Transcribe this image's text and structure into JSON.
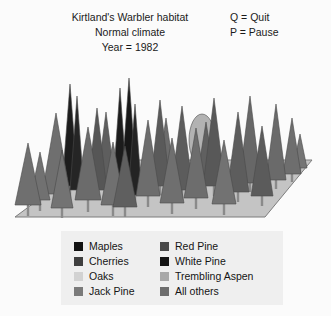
{
  "header": {
    "title_lines": [
      "Kirtland's Warbler habitat",
      "Normal climate",
      "Year = 1982"
    ],
    "keys": [
      "Q = Quit",
      "P = Pause"
    ]
  },
  "scene": {
    "ground_color": "#c4c4c4",
    "ground_edge_color": "#7d7d7d",
    "background_color": "#fbfbfb",
    "trunk_color": "#8a8a8a",
    "ground_polygon": "15,217 92,160 312,160 265,217",
    "trees": [
      {
        "species": "Jack Pine",
        "shape": "cone",
        "x": 28,
        "base": 205,
        "top": 143,
        "half_width": 13,
        "color": "#6f6f6f",
        "trunk_bottom": 216
      },
      {
        "species": "Jack Pine",
        "shape": "cone",
        "x": 56,
        "base": 194,
        "top": 113,
        "half_width": 14,
        "color": "#6f6f6f",
        "trunk_bottom": 206
      },
      {
        "species": "White Pine",
        "shape": "cone",
        "x": 70,
        "base": 186,
        "top": 84,
        "half_width": 8,
        "color": "#1d1d1d",
        "trunk_bottom": 198
      },
      {
        "species": "White Pine",
        "shape": "cone",
        "x": 77,
        "base": 190,
        "top": 96,
        "half_width": 7,
        "color": "#252525",
        "trunk_bottom": 200
      },
      {
        "species": "Jack Pine",
        "shape": "cone",
        "x": 62,
        "base": 208,
        "top": 150,
        "half_width": 11,
        "color": "#737373",
        "trunk_bottom": 218
      },
      {
        "species": "Jack Pine",
        "shape": "cone",
        "x": 88,
        "base": 200,
        "top": 127,
        "half_width": 13,
        "color": "#6b6b6b",
        "trunk_bottom": 212
      },
      {
        "species": "Red Pine",
        "shape": "cone",
        "x": 97,
        "base": 190,
        "top": 108,
        "half_width": 10,
        "color": "#565656",
        "trunk_bottom": 200
      },
      {
        "species": "Jack Pine",
        "shape": "cone",
        "x": 113,
        "base": 205,
        "top": 142,
        "half_width": 12,
        "color": "#707070",
        "trunk_bottom": 216
      },
      {
        "species": "White Pine",
        "shape": "cone",
        "x": 120,
        "base": 183,
        "top": 88,
        "half_width": 7,
        "color": "#1c1c1c",
        "trunk_bottom": 192
      },
      {
        "species": "White Pine",
        "shape": "cone",
        "x": 129,
        "base": 186,
        "top": 78,
        "half_width": 8,
        "color": "#171717",
        "trunk_bottom": 196
      },
      {
        "species": "White Pine",
        "shape": "cone",
        "x": 135,
        "base": 195,
        "top": 104,
        "half_width": 7,
        "color": "#232323",
        "trunk_bottom": 206
      },
      {
        "species": "Red Pine",
        "shape": "cone",
        "x": 125,
        "base": 207,
        "top": 146,
        "half_width": 12,
        "color": "#5f5f5f",
        "trunk_bottom": 217
      },
      {
        "species": "Jack Pine",
        "shape": "cone",
        "x": 148,
        "base": 196,
        "top": 120,
        "half_width": 12,
        "color": "#6d6d6d",
        "trunk_bottom": 207
      },
      {
        "species": "Red Pine",
        "shape": "cone",
        "x": 160,
        "base": 186,
        "top": 100,
        "half_width": 10,
        "color": "#5a5a5a",
        "trunk_bottom": 195
      },
      {
        "species": "Jack Pine",
        "shape": "cone",
        "x": 172,
        "base": 203,
        "top": 138,
        "half_width": 12,
        "color": "#6f6f6f",
        "trunk_bottom": 214
      },
      {
        "species": "Red Pine",
        "shape": "cone",
        "x": 182,
        "base": 190,
        "top": 106,
        "half_width": 11,
        "color": "#5c5c5c",
        "trunk_bottom": 200
      },
      {
        "species": "Oaks",
        "shape": "oval",
        "x": 202,
        "base": 166,
        "top": 114,
        "half_width": 13,
        "color": "#b2b2b2",
        "trunk_bottom": 180
      },
      {
        "species": "Jack Pine",
        "shape": "cone",
        "x": 196,
        "base": 198,
        "top": 128,
        "half_width": 12,
        "color": "#6d6d6d",
        "trunk_bottom": 209
      },
      {
        "species": "Red Pine",
        "shape": "cone",
        "x": 214,
        "base": 186,
        "top": 98,
        "half_width": 11,
        "color": "#585858",
        "trunk_bottom": 196
      },
      {
        "species": "Jack Pine",
        "shape": "cone",
        "x": 224,
        "base": 204,
        "top": 140,
        "half_width": 12,
        "color": "#727272",
        "trunk_bottom": 215
      },
      {
        "species": "Red Pine",
        "shape": "cone",
        "x": 238,
        "base": 192,
        "top": 112,
        "half_width": 11,
        "color": "#5d5d5d",
        "trunk_bottom": 202
      },
      {
        "species": "Jack Pine",
        "shape": "cone",
        "x": 250,
        "base": 183,
        "top": 96,
        "half_width": 11,
        "color": "#676767",
        "trunk_bottom": 192
      },
      {
        "species": "Red Pine",
        "shape": "cone",
        "x": 262,
        "base": 196,
        "top": 126,
        "half_width": 11,
        "color": "#5b5b5b",
        "trunk_bottom": 206
      },
      {
        "species": "Trembling Aspen",
        "shape": "cone",
        "x": 276,
        "base": 180,
        "top": 104,
        "half_width": 10,
        "color": "#6a6a6a",
        "trunk_bottom": 189
      },
      {
        "species": "All others",
        "shape": "cone",
        "x": 292,
        "base": 174,
        "top": 118,
        "half_width": 9,
        "color": "#6e6e6e",
        "trunk_bottom": 182
      },
      {
        "species": "Jack Pine",
        "shape": "cone",
        "x": 300,
        "base": 168,
        "top": 134,
        "half_width": 7,
        "color": "#757575",
        "trunk_bottom": 174
      },
      {
        "species": "Jack Pine",
        "shape": "cone",
        "x": 40,
        "base": 200,
        "top": 152,
        "half_width": 10,
        "color": "#717171",
        "trunk_bottom": 211
      },
      {
        "species": "Red Pine",
        "shape": "cone",
        "x": 106,
        "base": 181,
        "top": 112,
        "half_width": 9,
        "color": "#5e5e5e",
        "trunk_bottom": 189
      },
      {
        "species": "Jack Pine",
        "shape": "cone",
        "x": 166,
        "base": 172,
        "top": 118,
        "half_width": 8,
        "color": "#6c6c6c",
        "trunk_bottom": 179
      },
      {
        "species": "Red Pine",
        "shape": "cone",
        "x": 206,
        "base": 178,
        "top": 122,
        "half_width": 9,
        "color": "#606060",
        "trunk_bottom": 185
      }
    ]
  },
  "legend": {
    "background_color": "#efefef",
    "left_column": [
      {
        "label": "Maples",
        "color": "#121212"
      },
      {
        "label": "Cherries",
        "color": "#3f3f3f"
      },
      {
        "label": "Oaks",
        "color": "#d2d2d2"
      },
      {
        "label": "Jack Pine",
        "color": "#7a7a7a"
      }
    ],
    "right_column": [
      {
        "label": "Red Pine",
        "color": "#4a4a4a"
      },
      {
        "label": "White Pine",
        "color": "#141414"
      },
      {
        "label": "Trembling Aspen",
        "color": "#a8a8a8"
      },
      {
        "label": "All others",
        "color": "#6d6d6d"
      }
    ]
  }
}
